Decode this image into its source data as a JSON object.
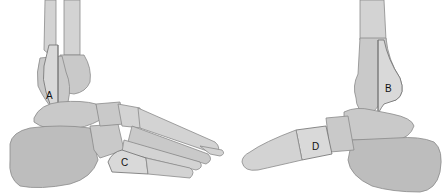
{
  "figure": {
    "left_view": {
      "description": "lateral view of right foot and ankle",
      "labels": [
        {
          "id": "A",
          "text": "A",
          "region": "distal fibula"
        },
        {
          "id": "C",
          "text": "C",
          "region": "base of fifth metatarsal"
        }
      ]
    },
    "right_view": {
      "description": "medial view of foot and ankle",
      "labels": [
        {
          "id": "B",
          "text": "B",
          "region": "medial malleolus (distal tibia)"
        },
        {
          "id": "D",
          "text": "D",
          "region": "navicular / midfoot"
        }
      ]
    },
    "colors": {
      "bone": "#c9c9c9",
      "outline": "#8a8a8a",
      "highlight": "#d9d9d9",
      "background": "#ffffff"
    }
  }
}
